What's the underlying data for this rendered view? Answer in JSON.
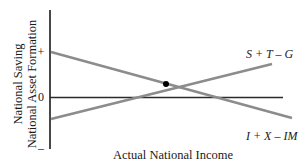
{
  "diagram": {
    "y_axis_label_line1": "National Saving",
    "y_axis_label_line2": "National Asset Formation",
    "x_axis_label": "Actual National Income",
    "ticks": {
      "plus": "+",
      "zero": "0",
      "minus": "–"
    },
    "curves": [
      {
        "name": "saving",
        "label": "S + T – G",
        "direction": "upward-sloping",
        "color": "#8c8c8c"
      },
      {
        "name": "asset-formation",
        "label": "I + X – IM",
        "direction": "downward-sloping",
        "color": "#8c8c8c"
      }
    ],
    "equilibrium_point": {
      "label": "",
      "color": "#000000"
    },
    "colors": {
      "axis": "#1a1a1a",
      "curve": "#8c8c8c",
      "zero_line": "#2a2a2a"
    }
  }
}
